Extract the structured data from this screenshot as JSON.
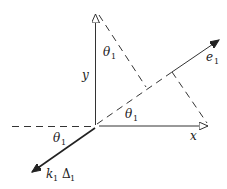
{
  "diagram": {
    "labels": {
      "y_axis": "y",
      "x_axis": "x",
      "e_vector": "e",
      "e_sub": "1",
      "theta_top": "θ",
      "theta_top_sub": "1",
      "theta_mid": "θ",
      "theta_mid_sub": "1",
      "theta_bottom": "θ",
      "theta_bottom_sub": "1",
      "k_vector": "k",
      "k_sub": "1",
      "delta": "Δ",
      "delta_sub": "1"
    },
    "colors": {
      "line": "#333333",
      "background": "#ffffff"
    }
  }
}
